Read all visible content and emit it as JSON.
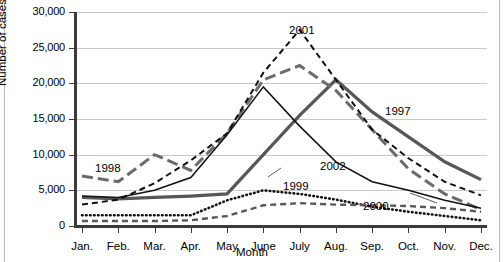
{
  "chart_data": {
    "type": "line",
    "title": "",
    "xlabel": "Month",
    "ylabel": "Number of cases",
    "categories": [
      "Jan.",
      "Feb.",
      "Mar.",
      "Apr.",
      "May",
      "June",
      "July",
      "Aug.",
      "Sep.",
      "Oct.",
      "Nov.",
      "Dec."
    ],
    "ylim": [
      0,
      30000
    ],
    "yticks": [
      0,
      5000,
      10000,
      15000,
      20000,
      25000,
      30000
    ],
    "ytick_labels": [
      "0",
      "5,000",
      "10,000",
      "15,000",
      "20,000",
      "25,000",
      "30,000"
    ],
    "grid": true,
    "legend_position": "inline-annotations",
    "series": [
      {
        "name": "1997",
        "style": "solid-thick-gray",
        "color": "#575757",
        "values": [
          4000,
          3800,
          4000,
          4200,
          4500,
          10000,
          15500,
          20500,
          16000,
          12500,
          9000,
          6500
        ],
        "label": {
          "text": "1997",
          "x": 385,
          "y": 105
        }
      },
      {
        "name": "1998",
        "style": "long-dash-gray",
        "color": "#6b6b6b",
        "values": [
          7000,
          6200,
          10000,
          7800,
          13000,
          20500,
          22500,
          19000,
          13500,
          8000,
          4500,
          2300
        ],
        "label": {
          "text": "1998",
          "x": 95,
          "y": 162
        }
      },
      {
        "name": "1999",
        "style": "dotted-black",
        "color": "#111111",
        "values": [
          1500,
          1500,
          1500,
          1500,
          3600,
          5000,
          4500,
          3700,
          2700,
          2000,
          1400,
          800
        ],
        "label": {
          "text": "1999",
          "x": 283,
          "y": 180
        }
      },
      {
        "name": "2000",
        "style": "short-dash-gray",
        "color": "#595959",
        "values": [
          700,
          700,
          700,
          800,
          1400,
          2900,
          3200,
          3000,
          2900,
          2800,
          2500,
          2000
        ],
        "label": {
          "text": "2000",
          "x": 363,
          "y": 200
        }
      },
      {
        "name": "2001",
        "style": "dash-black",
        "color": "#111111",
        "values": [
          3000,
          3700,
          6000,
          9200,
          13000,
          21500,
          27500,
          20500,
          13500,
          9500,
          6200,
          4300
        ],
        "label": {
          "text": "2001",
          "x": 289,
          "y": 24
        }
      },
      {
        "name": "2002",
        "style": "solid-thin-black",
        "color": "#111111",
        "values": [
          4200,
          4000,
          5000,
          6800,
          12800,
          19500,
          14000,
          9000,
          6200,
          5000,
          3600,
          2500
        ],
        "label": {
          "text": "2002",
          "x": 320,
          "y": 160
        }
      }
    ]
  }
}
